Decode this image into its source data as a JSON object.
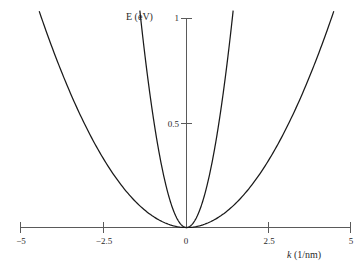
{
  "figure": {
    "background_color": "#ffffff",
    "axis_color": "#5a5a5a",
    "curve_color": "#1a1a1a",
    "text_color": "#2a2a2a"
  },
  "chart_data": {
    "type": "line",
    "title": "",
    "xlabel": "k (1/nm)",
    "xlabel_symbol": "k",
    "xlabel_units": "(1/nm)",
    "ylabel": "E (eV)",
    "xlim": [
      -5,
      5
    ],
    "ylim": [
      0,
      1.3
    ],
    "xticks": [
      -5,
      -2.5,
      0,
      2.5,
      5
    ],
    "xticklabels": [
      "−5",
      "−2.5",
      "0",
      "2.5",
      "5"
    ],
    "yticks": [
      0.5,
      1
    ],
    "yticklabels": [
      "0.5",
      "1"
    ],
    "grid": false,
    "legend": "none",
    "origin_label": "0",
    "series": [
      {
        "name": "narrow parabola (light effective mass)",
        "form": "E = 0.51 k^2",
        "coefficient": 0.51,
        "x": [
          -1.4,
          -1.2,
          -1.0,
          -0.8,
          -0.6,
          -0.4,
          -0.2,
          0,
          0.2,
          0.4,
          0.6,
          0.8,
          1.0,
          1.2,
          1.4
        ],
        "y": [
          1.0,
          0.734,
          0.51,
          0.326,
          0.184,
          0.082,
          0.02,
          0,
          0.02,
          0.082,
          0.184,
          0.326,
          0.51,
          0.734,
          1.0
        ]
      },
      {
        "name": "wide parabola (heavy effective mass)",
        "form": "E = 0.051 k^2",
        "coefficient": 0.051,
        "x": [
          -5,
          -4,
          -3,
          -2.5,
          -2,
          -1,
          0,
          1,
          2,
          2.5,
          3,
          4,
          5
        ],
        "y": [
          1.275,
          0.816,
          0.459,
          0.319,
          0.204,
          0.051,
          0,
          0.051,
          0.204,
          0.319,
          0.459,
          0.816,
          1.275
        ]
      }
    ]
  }
}
